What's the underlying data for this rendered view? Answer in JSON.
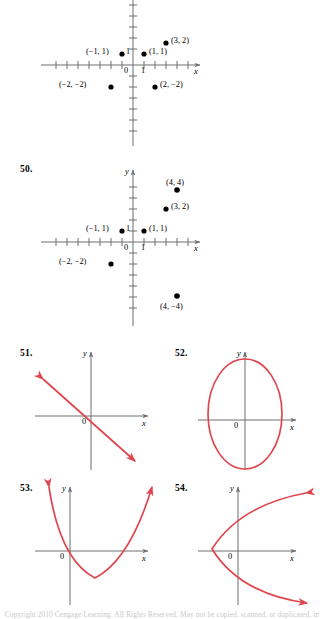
{
  "page": {
    "background": "#ffffff",
    "axis_color": "#6f6f6f",
    "curve_color": "#e0454e",
    "point_color": "#000000",
    "footer_text": "Copyright 2010 Cengage Learning. All Rights Reserved. May not be copied, scanned, or duplicated, in whole or in part."
  },
  "exercises": [
    {
      "number": "",
      "id": "graph-49",
      "type": "scatter",
      "chart": {
        "type": "scatter",
        "xlabel": "x",
        "ylabel": "",
        "xlim": [
          -5,
          5
        ],
        "ylim": [
          -5,
          5
        ],
        "grid": false,
        "origin_label": "0",
        "x_tick_label": "1",
        "y_tick_label": "1",
        "points": [
          {
            "x": -2,
            "y": -2,
            "label": "(−2, −2)",
            "label_pos": "left"
          },
          {
            "x": -1,
            "y": 1,
            "label": "(−1, 1)",
            "label_pos": "left"
          },
          {
            "x": 1,
            "y": 1,
            "label": "(1, 1)",
            "label_pos": "right"
          },
          {
            "x": 2,
            "y": -2,
            "label": "(2, −2)",
            "label_pos": "right"
          },
          {
            "x": 3,
            "y": 2,
            "label": "(3, 2)",
            "label_pos": "right"
          }
        ]
      }
    },
    {
      "number": "50.",
      "id": "graph-50",
      "type": "scatter",
      "chart": {
        "type": "scatter",
        "xlabel": "x",
        "ylabel": "y",
        "xlim": [
          -5,
          5
        ],
        "ylim": [
          -5,
          5
        ],
        "grid": false,
        "origin_label": "0",
        "x_tick_label": "1",
        "y_tick_label": "1",
        "points": [
          {
            "x": -2,
            "y": -2,
            "label": "(−2, −2)",
            "label_pos": "left"
          },
          {
            "x": -1,
            "y": 1,
            "label": "(−1, 1)",
            "label_pos": "left"
          },
          {
            "x": 1,
            "y": 1,
            "label": "(1, 1)",
            "label_pos": "right"
          },
          {
            "x": 3,
            "y": 2,
            "label": "(3, 2)",
            "label_pos": "right"
          },
          {
            "x": 4,
            "y": 4,
            "label": "(4, 4)",
            "label_pos": "above"
          },
          {
            "x": 4,
            "y": -4,
            "label": "(4, −4)",
            "label_pos": "below"
          }
        ]
      }
    },
    {
      "number": "51.",
      "id": "graph-51",
      "type": "line",
      "chart": {
        "type": "line",
        "xlabel": "x",
        "ylabel": "y",
        "grid": false,
        "origin_label": "0",
        "description": "decreasing straight line with arrowheads at both ends"
      }
    },
    {
      "number": "52.",
      "id": "graph-52",
      "type": "curve",
      "chart": {
        "type": "line",
        "xlabel": "x",
        "ylabel": "y",
        "grid": false,
        "origin_label": "0",
        "description": "vertical ellipse centered on the origin"
      }
    },
    {
      "number": "53.",
      "id": "graph-53",
      "type": "curve",
      "chart": {
        "type": "line",
        "xlabel": "x",
        "ylabel": "y",
        "grid": false,
        "origin_label": "0",
        "description": "upward opening parabola with arrowheads on both arms"
      }
    },
    {
      "number": "54.",
      "id": "graph-54",
      "type": "curve",
      "chart": {
        "type": "line",
        "xlabel": "x",
        "ylabel": "y",
        "grid": false,
        "origin_label": "0",
        "description": "rightward opening parabola with arrowheads on both arms"
      }
    }
  ]
}
